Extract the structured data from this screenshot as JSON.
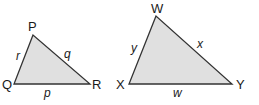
{
  "figure": {
    "fill_color": "#e0e0e0",
    "stroke_color": "#333333",
    "triangles": [
      {
        "name": "PQR",
        "vertices": {
          "P": "P",
          "Q": "Q",
          "R": "R"
        },
        "sides": {
          "r": "r",
          "q": "q",
          "p": "p"
        }
      },
      {
        "name": "WXY",
        "vertices": {
          "W": "W",
          "X": "X",
          "Y": "Y"
        },
        "sides": {
          "y": "y",
          "x": "x",
          "w": "w"
        }
      }
    ]
  }
}
